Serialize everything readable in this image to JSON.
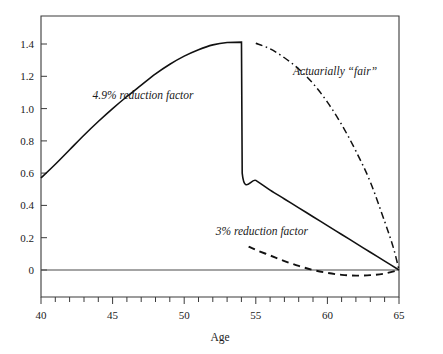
{
  "chart_data": {
    "type": "line",
    "title": "",
    "xlabel": "Age",
    "ylabel": "",
    "xlim": [
      40,
      65
    ],
    "ylim": [
      -0.06,
      1.52
    ],
    "grid": false,
    "legend_position": "inline-annotations",
    "x_ticks_major": [
      40,
      45,
      50,
      55,
      60,
      65
    ],
    "x_ticks_major_labels": [
      "40",
      "45",
      "50",
      "55",
      "60",
      "65"
    ],
    "x_ticks_minor_step": 1,
    "y_ticks": [
      0,
      0.2,
      0.4,
      0.6,
      0.8,
      1.0,
      1.2,
      1.4
    ],
    "y_tick_labels": [
      "0",
      "0.2",
      "0.4",
      "0.6",
      "0.8",
      "1.0",
      "1.2",
      "1.4"
    ],
    "series": [
      {
        "name": "4.9% reduction factor",
        "style": "solid",
        "x": [
          40,
          41,
          42,
          43,
          44,
          45,
          46,
          47,
          48,
          49,
          50,
          51,
          52,
          53,
          54,
          54.05,
          55,
          56,
          57,
          58,
          59,
          60,
          61,
          62,
          63,
          64,
          65
        ],
        "values": [
          0.57,
          0.655,
          0.745,
          0.835,
          0.92,
          1.0,
          1.075,
          1.145,
          1.215,
          1.275,
          1.325,
          1.365,
          1.395,
          1.41,
          1.412,
          0.6,
          0.555,
          0.495,
          0.44,
          0.385,
          0.33,
          0.275,
          0.22,
          0.165,
          0.11,
          0.055,
          0.0
        ]
      },
      {
        "name": "3% reduction factor",
        "style": "dashed",
        "x": [
          54.5,
          55,
          56,
          57,
          58,
          59,
          60,
          61,
          62,
          63,
          64,
          65
        ],
        "values": [
          0.145,
          0.125,
          0.09,
          0.055,
          0.025,
          0.0,
          -0.018,
          -0.03,
          -0.035,
          -0.032,
          -0.022,
          0.0
        ]
      },
      {
        "name": "Actuarially “fair”",
        "style": "dashdot",
        "x": [
          55,
          56,
          57,
          58,
          59,
          60,
          61,
          62,
          63,
          64,
          64.6,
          65
        ],
        "values": [
          1.405,
          1.37,
          1.315,
          1.245,
          1.155,
          1.04,
          0.9,
          0.735,
          0.545,
          0.3,
          0.14,
          0.0
        ]
      }
    ],
    "annotations": [
      {
        "text": "4.9% reduction factor",
        "x": 43.6,
        "y": 1.06,
        "italic": true
      },
      {
        "text": "Actuarially “fair”",
        "x": 57.6,
        "y": 1.21,
        "italic": true
      },
      {
        "text": "3% reduction factor",
        "x": 52.2,
        "y": 0.215,
        "italic": true
      }
    ]
  },
  "axes": {
    "x_axis_title": "Age",
    "x_tick_labels": [
      "40",
      "45",
      "50",
      "55",
      "60",
      "65"
    ],
    "y_tick_labels": [
      "1.4",
      "1.2",
      "1.0",
      "0.8",
      "0.6",
      "0.4",
      "0.2",
      "0"
    ]
  },
  "annotations": {
    "solid_label": "4.9% reduction factor",
    "dashdot_label": "Actuarially “fair”",
    "dashed_label": "3% reduction factor"
  },
  "colors": {
    "line": "#111111",
    "frame": "#3a3a3a",
    "background": "#ffffff",
    "text": "#1a1a1a"
  }
}
